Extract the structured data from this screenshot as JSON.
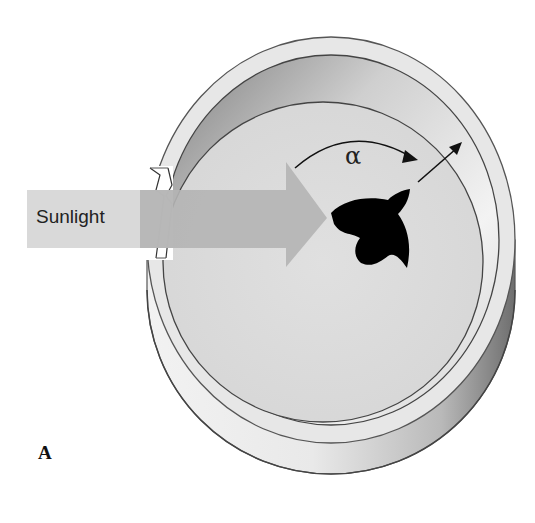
{
  "figure": {
    "panel_label": "A",
    "sunlight_label": "Sunlight",
    "angle_label": "α",
    "colors": {
      "background": "#ffffff",
      "rim_light": "#e6e6e6",
      "rim_shadow": "#8a8a8a",
      "floor": "#dcdcdc",
      "arrow": "#b5b5b5",
      "sunlight_band": "#d6d6d6",
      "bird": "#000000",
      "outline": "#555555"
    }
  }
}
